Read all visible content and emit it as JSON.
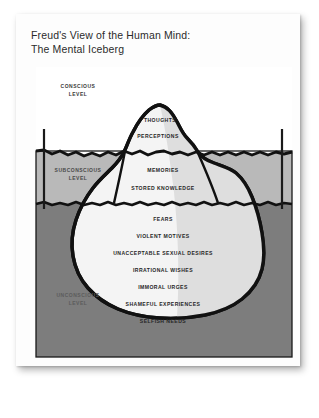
{
  "title": "Freud's View of the Human Mind:\nThe Mental Iceberg",
  "levels": [
    {
      "id": "conscious",
      "label": "CONSCIOUS\nLEVEL"
    },
    {
      "id": "subconscious",
      "label": "SUBCONSCIOUS\nLEVEL"
    },
    {
      "id": "unconscious",
      "label": "UNCONSCIOUS\nLEVEL"
    }
  ],
  "iceberg_labels": {
    "conscious": [
      "THOUGHTS",
      "PERCEPTIONS"
    ],
    "subconscious": [
      "MEMORIES",
      "STORED KNOWLEDGE"
    ],
    "unconscious": [
      "FEARS",
      "VIOLENT MOTIVES",
      "UNACCEPTABLE SEXUAL DESIRES",
      "IRRATIONAL WISHES",
      "IMMORAL URGES",
      "SHAMEFUL EXPERIENCES",
      "SELFISH NEEDS"
    ]
  },
  "colors": {
    "card": "#fdfdfd",
    "page": "#ffffff",
    "sky": "#ffffff",
    "water_upper": "#b9b9b9",
    "water_lower": "#7d7d7d",
    "iceberg_light": "#f4f4f4",
    "iceberg_shade": "#dedede",
    "outline": "#111111",
    "text": "#2b2b2b"
  },
  "flat_labels": {
    "t0": "THOUGHTS",
    "t1": "PERCEPTIONS",
    "t2": "MEMORIES",
    "t3": "STORED KNOWLEDGE",
    "t4": "FEARS",
    "t5": "VIOLENT MOTIVES",
    "t6": "UNACCEPTABLE SEXUAL DESIRES",
    "t7": "IRRATIONAL WISHES",
    "t8": "IMMORAL URGES",
    "t9": "SHAMEFUL EXPERIENCES",
    "t10": "SELFISH NEEDS",
    "s0": "CONSCIOUS\nLEVEL",
    "s1": "SUBCONSCIOUS\nLEVEL",
    "s2": "UNCONSCIOUS\nLEVEL"
  }
}
